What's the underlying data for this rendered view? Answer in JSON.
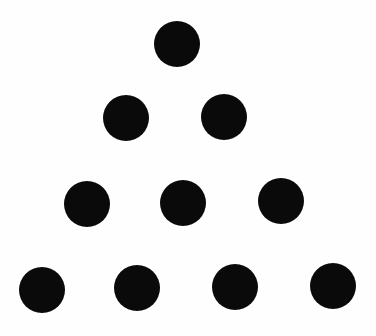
{
  "diagram": {
    "type": "triangular-dot-arrangement",
    "rows": 4,
    "total_dots": 10,
    "dot_color": "#0a0a0a",
    "background_color": "#fefefe",
    "dots": [
      {
        "row": 1,
        "cx": 177,
        "cy": 44,
        "r": 23
      },
      {
        "row": 2,
        "cx": 126,
        "cy": 118,
        "r": 23
      },
      {
        "row": 2,
        "cx": 224,
        "cy": 117,
        "r": 23
      },
      {
        "row": 3,
        "cx": 87,
        "cy": 204,
        "r": 23
      },
      {
        "row": 3,
        "cx": 183,
        "cy": 203,
        "r": 23
      },
      {
        "row": 3,
        "cx": 281,
        "cy": 201,
        "r": 23
      },
      {
        "row": 4,
        "cx": 42,
        "cy": 290,
        "r": 23
      },
      {
        "row": 4,
        "cx": 137,
        "cy": 288,
        "r": 23
      },
      {
        "row": 4,
        "cx": 235,
        "cy": 287,
        "r": 23
      },
      {
        "row": 4,
        "cx": 333,
        "cy": 286,
        "r": 23
      }
    ]
  }
}
